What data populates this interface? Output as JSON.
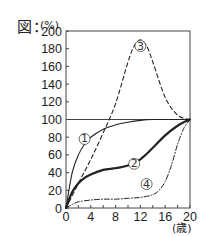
{
  "figure": {
    "label": "図：",
    "y_unit": "(%)",
    "x_unit": "(歳)"
  },
  "chart_data": {
    "type": "line",
    "title": "",
    "xlabel": "(歳)",
    "ylabel": "(%)",
    "xlim": [
      0,
      20
    ],
    "ylim": [
      0,
      200
    ],
    "x_ticks": [
      0,
      4,
      8,
      12,
      16,
      20
    ],
    "y_ticks": [
      0,
      20,
      40,
      60,
      80,
      100,
      120,
      140,
      160,
      180,
      200
    ],
    "reference_line": {
      "y": 100
    },
    "grid": false,
    "series": [
      {
        "name": "①",
        "style": "thin-solid",
        "x": [
          0,
          1,
          2,
          3,
          4,
          6,
          8,
          10,
          12,
          14,
          16,
          18,
          20
        ],
        "values": [
          0,
          40,
          60,
          72,
          80,
          89,
          94,
          97,
          99,
          100,
          100,
          100,
          100
        ],
        "label_pos": [
          3,
          78
        ]
      },
      {
        "name": "②",
        "style": "thick-solid",
        "x": [
          0,
          1,
          2,
          3,
          4,
          6,
          8,
          10,
          12,
          14,
          16,
          18,
          20
        ],
        "values": [
          0,
          18,
          28,
          34,
          38,
          43,
          45,
          48,
          55,
          68,
          82,
          93,
          100
        ],
        "label_pos": [
          11,
          50
        ]
      },
      {
        "name": "③",
        "style": "dashed",
        "x": [
          0,
          2,
          4,
          6,
          8,
          10,
          11,
          12,
          13,
          14,
          16,
          18,
          20
        ],
        "values": [
          0,
          28,
          55,
          85,
          118,
          165,
          183,
          190,
          183,
          165,
          125,
          105,
          100
        ],
        "label_pos": [
          12,
          183
        ]
      },
      {
        "name": "④",
        "style": "dash-dot",
        "x": [
          0,
          1,
          2,
          4,
          6,
          8,
          10,
          12,
          14,
          15,
          16,
          17,
          18,
          19,
          20
        ],
        "values": [
          0,
          4,
          7,
          9,
          10,
          10,
          11,
          12,
          15,
          20,
          30,
          48,
          72,
          90,
          100
        ],
        "label_pos": [
          13,
          27
        ]
      }
    ]
  }
}
